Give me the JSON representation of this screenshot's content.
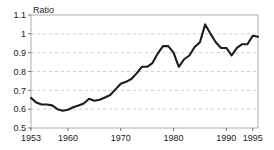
{
  "chart_data": {
    "type": "line",
    "title": "",
    "subtitle": "",
    "xlabel": "",
    "ylabel": "Ratio",
    "ylabel_position": "top-left-above-axis",
    "xlim": [
      1953,
      1996
    ],
    "ylim": [
      0.5,
      1.1
    ],
    "yticks": [
      0.5,
      0.6,
      0.7,
      0.8,
      0.9,
      1.0,
      1.1
    ],
    "ytick_labels": [
      "0.5",
      "0.6",
      "0.7",
      "0.8",
      "0.9",
      "1",
      "1.1"
    ],
    "xticks": [
      1953,
      1960,
      1970,
      1980,
      1990,
      1995
    ],
    "xtick_labels": [
      "1953",
      "1960",
      "1970",
      "1980",
      "1990",
      "1995"
    ],
    "grid": "horizontal-dashed",
    "legend": "none",
    "line_color": "#1c1c1c",
    "grid_color": "#b9b9b9",
    "frame_color": "#9a9a9a",
    "series": [
      {
        "name": "Ratio",
        "x": [
          1953,
          1954,
          1955,
          1956,
          1957,
          1958,
          1959,
          1960,
          1961,
          1962,
          1963,
          1964,
          1965,
          1966,
          1967,
          1968,
          1969,
          1970,
          1971,
          1972,
          1973,
          1974,
          1975,
          1976,
          1977,
          1978,
          1979,
          1980,
          1981,
          1982,
          1983,
          1984,
          1985,
          1986,
          1987,
          1988,
          1989,
          1990,
          1991,
          1992,
          1993,
          1994,
          1995,
          1996
        ],
        "values": [
          0.66,
          0.635,
          0.625,
          0.625,
          0.62,
          0.6,
          0.592,
          0.597,
          0.61,
          0.62,
          0.63,
          0.655,
          0.645,
          0.65,
          0.662,
          0.675,
          0.705,
          0.735,
          0.745,
          0.76,
          0.79,
          0.825,
          0.825,
          0.845,
          0.895,
          0.935,
          0.935,
          0.9,
          0.825,
          0.865,
          0.885,
          0.93,
          0.955,
          1.05,
          1.0,
          0.955,
          0.925,
          0.925,
          0.885,
          0.925,
          0.945,
          0.945,
          0.99,
          0.985
        ]
      }
    ]
  }
}
